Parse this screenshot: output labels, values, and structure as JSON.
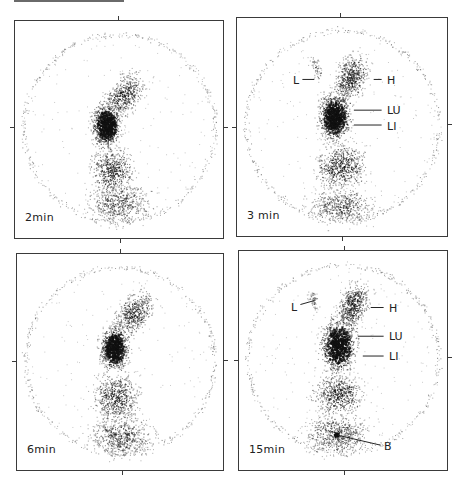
{
  "figure": {
    "panels": [
      {
        "id": "p1",
        "time_label": "2min",
        "box": {
          "x": 14,
          "y": 20,
          "w": 210,
          "h": 219
        },
        "ticks": {
          "top": 104,
          "right": 107,
          "bottom": 106,
          "left": 107
        },
        "blobs": [
          {
            "cx": 110,
            "cy": 75,
            "rx": 22,
            "ry": 38,
            "rot": 35,
            "n": 520,
            "dark": 0.55
          },
          {
            "cx": 92,
            "cy": 105,
            "rx": 20,
            "ry": 30,
            "rot": 0,
            "n": 900,
            "dark": 0.95
          },
          {
            "cx": 98,
            "cy": 150,
            "rx": 30,
            "ry": 30,
            "rot": -10,
            "n": 520,
            "dark": 0.6
          },
          {
            "cx": 105,
            "cy": 185,
            "rx": 45,
            "ry": 30,
            "rot": 0,
            "n": 600,
            "dark": 0.4
          }
        ],
        "annotations": []
      },
      {
        "id": "p2",
        "time_label": "3 min",
        "box": {
          "x": 236,
          "y": 17,
          "w": 212,
          "h": 220
        },
        "ticks": {
          "top": 104,
          "right": 107,
          "bottom": 106,
          "left": 110
        },
        "blobs": [
          {
            "cx": 115,
            "cy": 60,
            "rx": 22,
            "ry": 34,
            "rot": 20,
            "n": 560,
            "dark": 0.6
          },
          {
            "cx": 98,
            "cy": 100,
            "rx": 22,
            "ry": 32,
            "rot": 0,
            "n": 1000,
            "dark": 1.0
          },
          {
            "cx": 105,
            "cy": 150,
            "rx": 35,
            "ry": 32,
            "rot": -5,
            "n": 620,
            "dark": 0.6
          },
          {
            "cx": 105,
            "cy": 190,
            "rx": 45,
            "ry": 25,
            "rot": 0,
            "n": 560,
            "dark": 0.4
          },
          {
            "cx": 80,
            "cy": 50,
            "rx": 8,
            "ry": 18,
            "rot": -20,
            "n": 60,
            "dark": 0.3
          }
        ],
        "annotations": [
          {
            "label": "L",
            "lx": 56,
            "ly": 57,
            "x1": 66,
            "y1": 62,
            "x2": 78,
            "y2": 62
          },
          {
            "label": "H",
            "lx": 150,
            "ly": 57,
            "x1": 138,
            "y1": 62,
            "x2": 146,
            "y2": 62
          },
          {
            "label": "LU",
            "lx": 150,
            "ly": 87,
            "x1": 118,
            "y1": 93,
            "x2": 146,
            "y2": 93
          },
          {
            "label": "LI",
            "lx": 150,
            "ly": 103,
            "x1": 118,
            "y1": 108,
            "x2": 146,
            "y2": 108
          }
        ]
      },
      {
        "id": "p3",
        "time_label": "6min",
        "box": {
          "x": 16,
          "y": 253,
          "w": 208,
          "h": 218
        },
        "ticks": {
          "top": 104,
          "right": 107,
          "bottom": 106,
          "left": 108
        },
        "blobs": [
          {
            "cx": 118,
            "cy": 60,
            "rx": 22,
            "ry": 36,
            "rot": 35,
            "n": 520,
            "dark": 0.55
          },
          {
            "cx": 98,
            "cy": 95,
            "rx": 20,
            "ry": 30,
            "rot": 0,
            "n": 900,
            "dark": 0.95
          },
          {
            "cx": 100,
            "cy": 145,
            "rx": 32,
            "ry": 35,
            "rot": -5,
            "n": 600,
            "dark": 0.6
          },
          {
            "cx": 105,
            "cy": 185,
            "rx": 45,
            "ry": 28,
            "rot": 0,
            "n": 620,
            "dark": 0.45
          }
        ],
        "annotations": []
      },
      {
        "id": "p4",
        "time_label": "15min",
        "box": {
          "x": 238,
          "y": 250,
          "w": 210,
          "h": 221
        },
        "ticks": {
          "top": 106,
          "right": 107,
          "bottom": 106,
          "left": 110
        },
        "blobs": [
          {
            "cx": 115,
            "cy": 55,
            "rx": 20,
            "ry": 32,
            "rot": 20,
            "n": 560,
            "dark": 0.6
          },
          {
            "cx": 100,
            "cy": 95,
            "rx": 25,
            "ry": 38,
            "rot": 5,
            "n": 1000,
            "dark": 0.95
          },
          {
            "cx": 100,
            "cy": 145,
            "rx": 35,
            "ry": 30,
            "rot": 0,
            "n": 600,
            "dark": 0.55
          },
          {
            "cx": 100,
            "cy": 185,
            "rx": 45,
            "ry": 28,
            "rot": 0,
            "n": 620,
            "dark": 0.45
          },
          {
            "cx": 98,
            "cy": 185,
            "rx": 5,
            "ry": 5,
            "rot": 0,
            "n": 60,
            "dark": 1.0
          },
          {
            "cx": 75,
            "cy": 50,
            "rx": 7,
            "ry": 16,
            "rot": -15,
            "n": 60,
            "dark": 0.3
          }
        ],
        "annotations": [
          {
            "label": "L",
            "lx": 52,
            "ly": 51,
            "x1": 62,
            "y1": 54,
            "x2": 76,
            "y2": 50
          },
          {
            "label": "H",
            "lx": 150,
            "ly": 52,
            "x1": 133,
            "y1": 57,
            "x2": 146,
            "y2": 57
          },
          {
            "label": "LU",
            "lx": 150,
            "ly": 80,
            "x1": 120,
            "y1": 86,
            "x2": 146,
            "y2": 86
          },
          {
            "label": "LI",
            "lx": 150,
            "ly": 100,
            "x1": 125,
            "y1": 106,
            "x2": 146,
            "y2": 106
          },
          {
            "label": "B",
            "lx": 145,
            "ly": 190,
            "x1": 100,
            "y1": 186,
            "x2": 143,
            "y2": 196
          }
        ]
      }
    ]
  }
}
